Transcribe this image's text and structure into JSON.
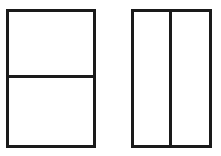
{
  "canvas": {
    "width": 221,
    "height": 156,
    "background_color": "#ffffff"
  },
  "style": {
    "stroke_color": "#1a1a1a",
    "stroke_width_px": 3,
    "fill_color": "#ffffff"
  },
  "figures": [
    {
      "id": "figure-horizontal-split",
      "shape": "rectangle",
      "orientation": "portrait",
      "division": "horizontal",
      "parts": 2,
      "x": 6,
      "y": 9,
      "width": 90,
      "height": 139,
      "divider": {
        "type": "horizontal-line",
        "position_y": 78,
        "offset_from_top": 66
      },
      "cells": [
        {
          "id": "cell-top",
          "position": "top",
          "fill": "#ffffff"
        },
        {
          "id": "cell-bottom",
          "position": "bottom",
          "fill": "#ffffff"
        }
      ]
    },
    {
      "id": "figure-vertical-split",
      "shape": "rectangle",
      "orientation": "portrait",
      "division": "vertical",
      "parts": 2,
      "x": 131,
      "y": 9,
      "width": 81,
      "height": 139,
      "divider": {
        "type": "vertical-line",
        "position_x": 169,
        "offset_from_left": 38
      },
      "cells": [
        {
          "id": "cell-left",
          "position": "left",
          "fill": "#ffffff"
        },
        {
          "id": "cell-right",
          "position": "right",
          "fill": "#ffffff"
        }
      ]
    }
  ],
  "labels": {
    "text_present": false,
    "items": []
  }
}
